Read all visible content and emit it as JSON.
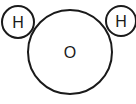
{
  "diagram": {
    "atoms": [
      {
        "symbol": "H",
        "cx": 18,
        "cy": 22,
        "r": 16
      },
      {
        "symbol": "O",
        "cx": 70,
        "cy": 52,
        "r": 42
      },
      {
        "symbol": "H",
        "cx": 121,
        "cy": 21,
        "r": 15
      }
    ],
    "colors": {
      "stroke": "#1a1a1a",
      "fill": "#ffffff"
    }
  }
}
